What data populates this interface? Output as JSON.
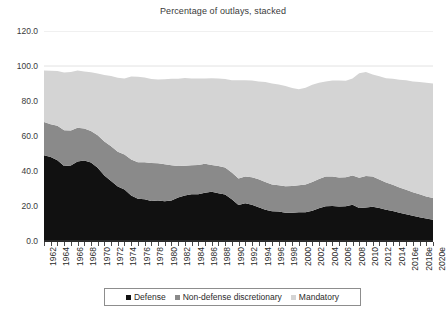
{
  "title": "Percentage of outlays, stacked",
  "yaxis": {
    "ticks": [
      "120.0",
      "100.0",
      "80.0",
      "60.0",
      "40.0",
      "20.0",
      "0.0"
    ],
    "min": 0,
    "max": 120,
    "step": 20
  },
  "legend": {
    "items": [
      {
        "label": "Defense",
        "color": "#111111"
      },
      {
        "label": "Non-defense discretionary",
        "color": "#8a8a8a"
      },
      {
        "label": "Mandatory",
        "color": "#d4d4d4"
      }
    ]
  },
  "chart_data": {
    "type": "area",
    "stacked": true,
    "title": "Percentage of outlays, stacked",
    "xlabel": "",
    "ylabel": "",
    "ylim": [
      0,
      120
    ],
    "grid": false,
    "legend_position": "bottom",
    "x": [
      "1962",
      "1963",
      "1964",
      "1965",
      "1966",
      "1967",
      "1968",
      "1969",
      "1970",
      "1971",
      "1972",
      "1973",
      "1974",
      "1975",
      "1976",
      "1977",
      "1978",
      "1979",
      "1980",
      "1981",
      "1982",
      "1983",
      "1984",
      "1985",
      "1986",
      "1987",
      "1988",
      "1989",
      "1990",
      "1991",
      "1992",
      "1993",
      "1994",
      "1995",
      "1996",
      "1997",
      "1998",
      "1999",
      "2000",
      "2001",
      "2002",
      "2003",
      "2004",
      "2005",
      "2006",
      "2007",
      "2008",
      "2009",
      "2010",
      "2011",
      "2012",
      "2013",
      "2014",
      "2015",
      "2016e",
      "2017e",
      "2018e",
      "2019e",
      "2020e"
    ],
    "tick_labels": [
      "1962",
      "1964",
      "1966",
      "1968",
      "1970",
      "1972",
      "1974",
      "1976",
      "1978",
      "1980",
      "1982",
      "1984",
      "1986",
      "1988",
      "1990",
      "1992",
      "1994",
      "1996",
      "1998",
      "2000",
      "2002",
      "2004",
      "2006",
      "2008",
      "2010",
      "2012",
      "2014",
      "2016e",
      "2018e",
      "2020e"
    ],
    "series": [
      {
        "name": "Defense",
        "color": "#111111",
        "values": [
          49.0,
          48.0,
          46.2,
          42.8,
          43.2,
          45.4,
          46.0,
          44.9,
          41.8,
          37.5,
          34.3,
          31.2,
          29.5,
          26.0,
          24.1,
          23.8,
          22.8,
          23.1,
          22.7,
          23.2,
          24.8,
          26.0,
          26.7,
          26.7,
          27.6,
          28.1,
          27.3,
          26.6,
          23.9,
          20.6,
          21.6,
          20.7,
          19.3,
          17.9,
          17.0,
          16.9,
          16.2,
          16.2,
          16.5,
          16.4,
          17.3,
          18.7,
          19.9,
          20.0,
          19.7,
          19.9,
          20.7,
          18.8,
          19.1,
          19.6,
          18.8,
          17.9,
          17.2,
          16.1,
          15.3,
          14.4,
          13.6,
          12.8,
          12.2
        ]
      },
      {
        "name": "Non-defense discretionary",
        "color": "#8a8a8a",
        "values": [
          19.0,
          18.7,
          19.6,
          20.5,
          20.0,
          19.3,
          18.3,
          17.9,
          18.6,
          19.4,
          19.9,
          19.8,
          20.0,
          20.6,
          20.9,
          21.2,
          21.8,
          21.4,
          21.2,
          20.1,
          18.0,
          17.0,
          16.6,
          16.7,
          16.5,
          15.4,
          15.6,
          15.4,
          15.3,
          15.1,
          15.3,
          15.7,
          16.0,
          15.8,
          15.3,
          15.0,
          15.1,
          15.2,
          15.3,
          15.9,
          16.4,
          16.7,
          16.9,
          16.8,
          16.6,
          16.5,
          16.8,
          17.4,
          18.1,
          17.2,
          16.3,
          15.5,
          15.0,
          14.5,
          14.0,
          13.5,
          13.1,
          12.7,
          12.4
        ]
      },
      {
        "name": "Mandatory",
        "color": "#d4d4d4",
        "values": [
          29.5,
          30.6,
          31.4,
          33.0,
          33.4,
          32.7,
          32.6,
          33.6,
          35.3,
          38.0,
          40.1,
          42.3,
          43.3,
          47.4,
          48.9,
          48.5,
          48.0,
          47.8,
          48.5,
          49.4,
          49.9,
          50.2,
          49.5,
          49.4,
          48.8,
          49.5,
          50.0,
          50.6,
          52.6,
          56.1,
          55.0,
          55.3,
          55.9,
          57.2,
          57.7,
          57.6,
          57.2,
          56.0,
          54.9,
          55.3,
          55.6,
          55.0,
          54.3,
          54.9,
          55.4,
          55.2,
          55.3,
          59.7,
          59.3,
          58.3,
          59.0,
          59.6,
          60.5,
          61.6,
          62.5,
          63.3,
          64.1,
          64.9,
          65.4
        ]
      }
    ],
    "totals_note": "Stacked total hovers near 95-98 percent of outlays, dipping to about 93 around 1999-2000"
  }
}
